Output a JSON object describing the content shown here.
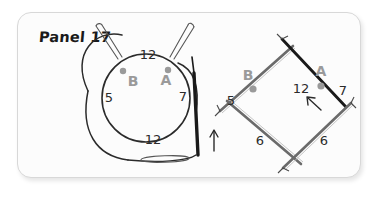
{
  "panel": {
    "title": "Panel 17",
    "background_color": "#fcfcfc",
    "border_color": "#d8d8d8"
  },
  "colors": {
    "ink": "#2b2b2b",
    "needle_light": "#6b6b6b",
    "needle_dark": "#1a1a1a",
    "marker_gray": "#9a9a9a",
    "label_gray": "#9a9a9a"
  },
  "diagrams": [
    {
      "id": "circular-needle-diagram",
      "type": "circular-needle",
      "description": "Circular knitting needle with cable loop, two stitch markers and an upward direction arrow",
      "markers": [
        {
          "label": "B",
          "position": "upper-left"
        },
        {
          "label": "A",
          "position": "upper-right"
        }
      ],
      "stitch_counts": [
        {
          "label": "12",
          "position": "top"
        },
        {
          "label": "5",
          "position": "left"
        },
        {
          "label": "7",
          "position": "right"
        },
        {
          "label": "12",
          "position": "bottom"
        }
      ],
      "direction_arrow": {
        "name": "direction-arrow",
        "points": "up"
      }
    },
    {
      "id": "dpn-diamond-diagram",
      "type": "double-pointed-needles",
      "description": "Four double-pointed needles arranged in a diamond, crossing at the corners, with two stitch markers and a direction arrow",
      "markers": [
        {
          "label": "B",
          "position": "upper-left"
        },
        {
          "label": "A",
          "position": "upper-right"
        }
      ],
      "stitch_counts": [
        {
          "label": "12",
          "position": "top"
        },
        {
          "label": "5",
          "position": "upper-left"
        },
        {
          "label": "7",
          "position": "upper-right"
        },
        {
          "label": "6",
          "position": "lower-left"
        },
        {
          "label": "6",
          "position": "lower-right"
        }
      ],
      "direction_arrow": {
        "name": "direction-arrow",
        "points": "up-left"
      }
    }
  ]
}
